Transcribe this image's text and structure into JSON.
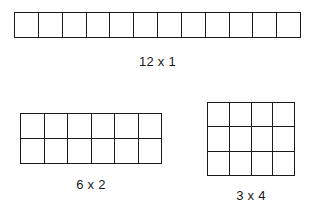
{
  "page": {
    "background_color": "#ffffff",
    "line_color": "#1a1a1a",
    "text_color": "#1a1a1a"
  },
  "figures": [
    {
      "id": "12x1",
      "label": "12 x 1",
      "columns": 12,
      "rows": 1,
      "total_cells": 12
    },
    {
      "id": "6x2",
      "label": "6 x 2",
      "columns": 6,
      "rows": 2,
      "total_cells": 12
    },
    {
      "id": "3x4",
      "label": "3 x 4",
      "columns": 4,
      "rows": 3,
      "total_cells": 12
    }
  ]
}
